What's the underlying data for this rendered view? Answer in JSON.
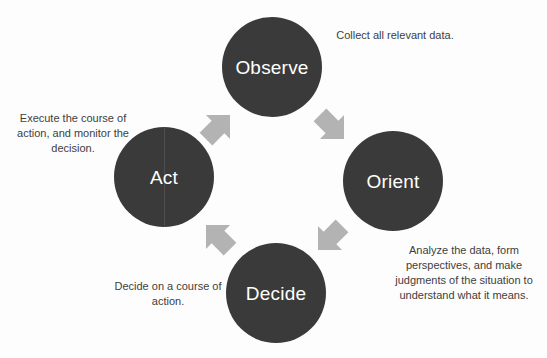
{
  "diagram": {
    "background_color": "#fdfdfd",
    "node_color": "#3a3a3a",
    "node_label_color": "#ffffff",
    "arrow_color": "#b3b3b3",
    "caption_color": "#404040",
    "nodes": [
      {
        "id": "observe",
        "label": "Observe",
        "position": "top"
      },
      {
        "id": "orient",
        "label": "Orient",
        "position": "right"
      },
      {
        "id": "decide",
        "label": "Decide",
        "position": "bottom"
      },
      {
        "id": "act",
        "label": "Act",
        "position": "left"
      }
    ],
    "captions": [
      {
        "id": "observe",
        "text": "Collect all relevant data."
      },
      {
        "id": "orient",
        "text": "Analyze the data, form perspectives, and make judgments of the situation to understand what it means."
      },
      {
        "id": "decide",
        "text": "Decide on a course of action."
      },
      {
        "id": "act",
        "text": "Execute the course of action, and monitor the decision."
      }
    ],
    "arrows": [
      {
        "id": "act-observe",
        "from": "Act",
        "to": "Observe",
        "direction": "up-right"
      },
      {
        "id": "observe-orient",
        "from": "Observe",
        "to": "Orient",
        "direction": "down-right"
      },
      {
        "id": "orient-decide",
        "from": "Orient",
        "to": "Decide",
        "direction": "down-left"
      },
      {
        "id": "decide-act",
        "from": "Decide",
        "to": "Act",
        "direction": "up-left"
      }
    ]
  }
}
